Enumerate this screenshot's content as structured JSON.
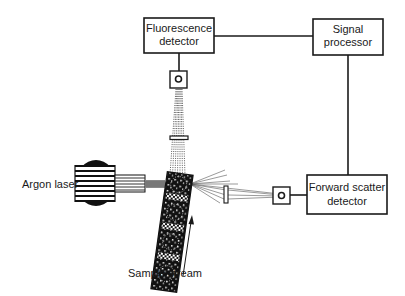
{
  "diagram": {
    "components": {
      "fluorescence_detector": {
        "line1": "Fluorescence",
        "line2": "detector"
      },
      "signal_processor": {
        "line1": "Signal",
        "line2": "processor"
      },
      "forward_scatter_detector": {
        "line1": "Forward scatter",
        "line2": "detector"
      },
      "argon_laser": {
        "label": "Argon laser"
      },
      "sample_stream": {
        "label": "Sample stream"
      }
    },
    "colors": {
      "stroke": "#1a1a1a",
      "background": "#ffffff"
    }
  }
}
